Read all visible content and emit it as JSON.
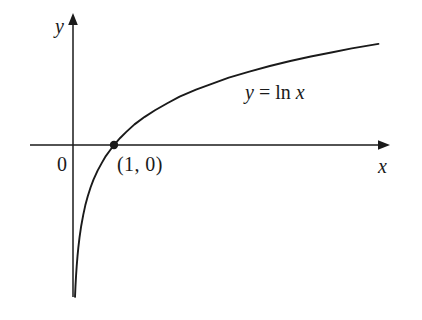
{
  "figure": {
    "kind": "math-graph",
    "background_color": "#ffffff",
    "ink_color": "#1a1a1a"
  },
  "labels": {
    "y_axis": "y",
    "x_axis": "x",
    "origin": "0",
    "point": "(1, 0)",
    "equation_lhs": "y",
    "equation_eq": "=",
    "equation_fn": "ln",
    "equation_arg": "x",
    "equation_full": "y = ln x"
  },
  "chart_data": {
    "type": "line",
    "title": "",
    "subtitle": "",
    "xlabel": "x",
    "ylabel": "y",
    "grid": false,
    "legend": null,
    "axis_style": "arrowed-cartesian",
    "xlim": [
      -1.05,
      7.7
    ],
    "ylim": [
      -3.05,
      2.65
    ],
    "series": [
      {
        "name": "y = ln x",
        "equation": "y = ln x",
        "color": "#1a1a1a",
        "linewidth": 1.9,
        "x": [
          0.049,
          0.06,
          0.075,
          0.09,
          0.11,
          0.13,
          0.16,
          0.2,
          0.25,
          0.3,
          0.36,
          0.43,
          0.5,
          0.6,
          0.7,
          0.8,
          0.9,
          1.0,
          1.15,
          1.3,
          1.5,
          1.75,
          2.0,
          2.3,
          2.6,
          3.0,
          3.4,
          3.8,
          4.3,
          4.8,
          5.3,
          5.8,
          6.3,
          6.8,
          7.45
        ],
        "y": [
          -3.02,
          -2.81,
          -2.59,
          -2.41,
          -2.21,
          -2.04,
          -1.83,
          -1.61,
          -1.39,
          -1.2,
          -1.02,
          -0.84,
          -0.69,
          -0.51,
          -0.36,
          -0.22,
          -0.11,
          0.0,
          0.14,
          0.26,
          0.41,
          0.56,
          0.69,
          0.83,
          0.96,
          1.1,
          1.22,
          1.34,
          1.46,
          1.57,
          1.67,
          1.76,
          1.84,
          1.92,
          2.01
        ]
      }
    ],
    "points": [
      {
        "label": "(1, 0)",
        "x": 1,
        "y": 0,
        "marker": "filled-circle",
        "color": "#1a1a1a"
      }
    ],
    "annotations": [
      {
        "text": "y = ln x",
        "x": 4.2,
        "y": 1.35
      },
      {
        "text": "0",
        "x": -0.38,
        "y": -0.45
      },
      {
        "text": "y",
        "x": -0.44,
        "y": 2.45
      },
      {
        "text": "x",
        "x": 7.45,
        "y": -0.37
      }
    ],
    "asymptote": {
      "type": "vertical",
      "x": 0,
      "note": "y-axis"
    }
  }
}
